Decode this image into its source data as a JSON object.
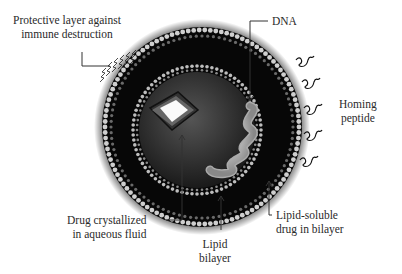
{
  "diagram": {
    "type": "liposome-drug-delivery",
    "labels": {
      "protective_layer": [
        "Protective layer against",
        "immune destruction"
      ],
      "dna": "DNA",
      "homing_peptide": [
        "Homing",
        "peptide"
      ],
      "drug_crystallized": [
        "Drug crystallized",
        "in aqueous fluid"
      ],
      "lipid_bilayer": [
        "Lipid",
        "bilayer"
      ],
      "lipid_soluble_drug": [
        "Lipid-soluble",
        "drug in bilayer"
      ]
    },
    "colors": {
      "background": "#ffffff",
      "shell": "#0a0a0a",
      "lipid_head": "#d8d8d8",
      "inner_core": "#2a2a2a",
      "leader_line": "#333333"
    }
  }
}
